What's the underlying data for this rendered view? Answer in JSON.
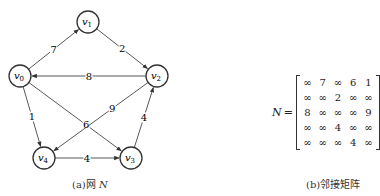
{
  "figure": {
    "network": {
      "caption": "(a)网",
      "caption_var": "N",
      "nodes": [
        {
          "id": "v0",
          "base": "v",
          "sub": "0",
          "x": 20,
          "y": 76
        },
        {
          "id": "v1",
          "base": "v",
          "sub": "1",
          "x": 88,
          "y": 22
        },
        {
          "id": "v2",
          "base": "v",
          "sub": "2",
          "x": 157,
          "y": 76
        },
        {
          "id": "v3",
          "base": "v",
          "sub": "3",
          "x": 131,
          "y": 158
        },
        {
          "id": "v4",
          "base": "v",
          "sub": "4",
          "x": 44,
          "y": 158
        }
      ],
      "edges": [
        {
          "from": "v0",
          "to": "v1",
          "weight": "7"
        },
        {
          "from": "v1",
          "to": "v2",
          "weight": "2"
        },
        {
          "from": "v2",
          "to": "v0",
          "weight": "8"
        },
        {
          "from": "v0",
          "to": "v4",
          "weight": "1"
        },
        {
          "from": "v0",
          "to": "v3",
          "weight": "6"
        },
        {
          "from": "v2",
          "to": "v4",
          "weight": "9"
        },
        {
          "from": "v3",
          "to": "v2",
          "weight": "4"
        },
        {
          "from": "v4",
          "to": "v3",
          "weight": "4"
        }
      ]
    },
    "matrix": {
      "name": "N",
      "equals": "=",
      "caption": "(b)邻接矩阵",
      "rows": [
        [
          "∞",
          "7",
          "∞",
          "6",
          "1"
        ],
        [
          "∞",
          "∞",
          "2",
          "∞",
          "∞"
        ],
        [
          "8",
          "∞",
          "∞",
          "∞",
          "9"
        ],
        [
          "∞",
          "∞",
          "4",
          "∞",
          "∞"
        ],
        [
          "∞",
          "∞",
          "∞",
          "4",
          "∞"
        ]
      ]
    }
  }
}
